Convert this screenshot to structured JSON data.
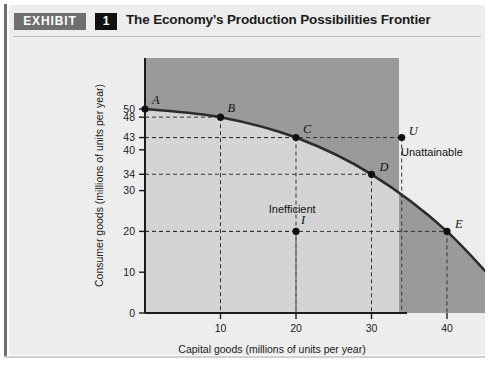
{
  "exhibit": {
    "tag": "EXHIBIT",
    "number": "1",
    "title": "The Economy’s Production Possibilities Frontier"
  },
  "colors": {
    "unattainable_fill": "#9a9a9a",
    "inefficient_fill": "#d4d4d4",
    "card_background": "#ededed",
    "curve": "#2b2b2b",
    "axis": "#1b1b1b",
    "tag_background": "#6f6f6f",
    "number_background": "#111111"
  },
  "chart_data": {
    "type": "line",
    "title": "The Economy’s Production Possibilities Frontier",
    "xlabel": "Capital goods (millions of units per year)",
    "ylabel": "Consumer goods (millions of units per year)",
    "xlim": [
      0,
      56
    ],
    "ylim": [
      0,
      56
    ],
    "xticks": [
      10,
      20,
      30,
      40,
      50
    ],
    "yticks": [
      0,
      10,
      20,
      30,
      34,
      40,
      43,
      48,
      50
    ],
    "grid": false,
    "legend": null,
    "series": [
      {
        "name": "Production possibilities frontier",
        "x": [
          0,
          10,
          20,
          30,
          40,
          50
        ],
        "values": [
          50,
          48,
          43,
          34,
          20,
          0
        ]
      }
    ],
    "frontier_points": [
      {
        "label": "A",
        "x": 0,
        "y": 50,
        "label_dx": 7,
        "label_dy": -5
      },
      {
        "label": "B",
        "x": 10,
        "y": 48,
        "label_dx": 7,
        "label_dy": -5
      },
      {
        "label": "C",
        "x": 20,
        "y": 43,
        "label_dx": 7,
        "label_dy": -5
      },
      {
        "label": "D",
        "x": 30,
        "y": 34,
        "label_dx": 8,
        "label_dy": -3
      },
      {
        "label": "E",
        "x": 40,
        "y": 20,
        "label_dx": 8,
        "label_dy": -3
      },
      {
        "label": "F",
        "x": 50,
        "y": 0,
        "label_dx": 7,
        "label_dy": -4
      }
    ],
    "other_points": [
      {
        "label": "I",
        "x": 20,
        "y": 20,
        "label_dx": 5,
        "label_dy": -7,
        "region": "inefficient"
      },
      {
        "label": "U",
        "x": 34,
        "y": 43,
        "label_dx": 7,
        "label_dy": -3,
        "region": "unattainable"
      }
    ],
    "annotations": [
      {
        "text": "Unattainable",
        "x": 38,
        "y": 38.5
      },
      {
        "text": "Inefficient",
        "x": 19.5,
        "y": 24.5
      }
    ]
  }
}
